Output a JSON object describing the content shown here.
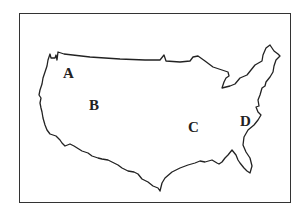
{
  "map": {
    "subject": "Outline map of the contiguous United States",
    "labels": [
      {
        "id": "A",
        "text": "A",
        "x": 63,
        "y": 66
      },
      {
        "id": "B",
        "text": "B",
        "x": 89,
        "y": 98
      },
      {
        "id": "C",
        "text": "C",
        "x": 188,
        "y": 120
      },
      {
        "id": "D",
        "text": "D",
        "x": 240,
        "y": 114
      }
    ],
    "colors": {
      "outline": "#222222",
      "frame": "#333333",
      "background": "#ffffff"
    }
  }
}
